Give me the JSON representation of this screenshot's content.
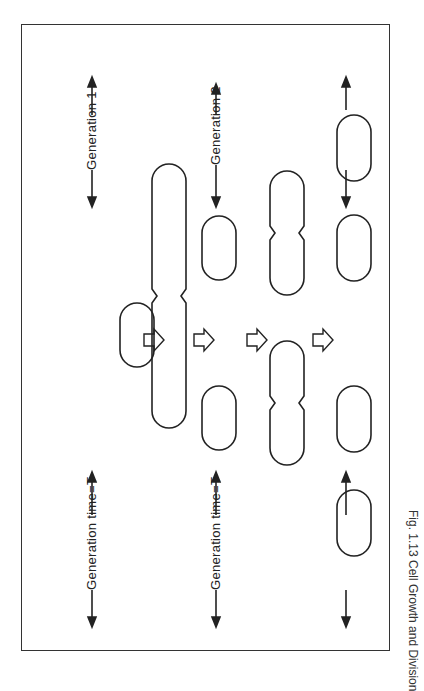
{
  "figure": {
    "caption": "Fig. 1.13 Cell Growth and Division",
    "labels": {
      "generation_1": "Generation 1",
      "generation_2": "Generation 2",
      "generation_time_1": "Generation time=T",
      "generation_time_2": "Generation time=T"
    },
    "stages": [
      "single cell",
      "elongated dividing cell",
      "two daughter cells",
      "two dividing cells",
      "four cells"
    ]
  }
}
